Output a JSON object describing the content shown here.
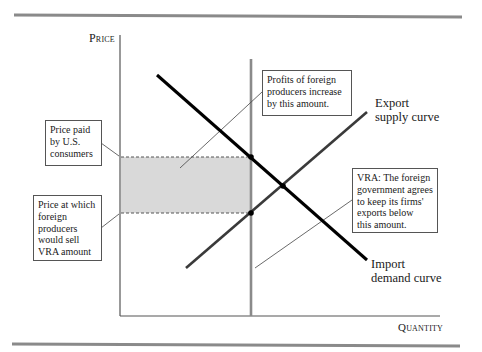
{
  "axes": {
    "y_label": "Price",
    "x_label": "Quantity"
  },
  "curves": {
    "export_supply": "Export supply curve",
    "export_supply_line1": "Export",
    "export_supply_line2": "supply curve",
    "import_demand": "Import demand curve",
    "import_demand_line1": "Import",
    "import_demand_line2": "demand curve"
  },
  "annotations": {
    "profits_box": {
      "line1": "Profits of foreign",
      "line2": "producers increase",
      "line3": "by this amount."
    },
    "price_paid_box": {
      "line1": "Price paid",
      "line2": "by U.S.",
      "line3": "consumers"
    },
    "price_sell_box": {
      "line1": "Price at which",
      "line2": "foreign",
      "line3": "producers",
      "line4": "would sell",
      "line5": "VRA amount"
    },
    "vra_box": {
      "line1": "VRA: The foreign",
      "line2": "government agrees",
      "line3": "to keep its firms'",
      "line4": "exports below",
      "line5": "this amount."
    }
  },
  "colors": {
    "rule": "#8a8a8a",
    "axis": "#555555",
    "demand": "#000000",
    "supply": "#3a3a3a",
    "vra_line": "#8a8a8a",
    "shaded_area": "#d9d9d9",
    "dashed": "#555555"
  }
}
